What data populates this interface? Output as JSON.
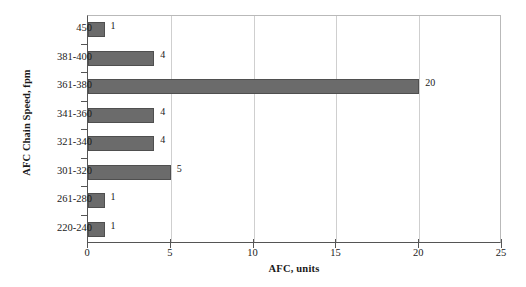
{
  "chart_data": {
    "type": "bar",
    "orientation": "horizontal",
    "title": "",
    "xlabel": "AFC, units",
    "ylabel": "AFC Chain Speed, fpm",
    "categories": [
      "450",
      "381-400",
      "361-380",
      "341-360",
      "321-340",
      "301-320",
      "261-280",
      "220-240"
    ],
    "values": [
      1,
      4,
      20,
      4,
      4,
      5,
      1,
      1
    ],
    "value_labels": [
      "1",
      "4",
      "20",
      "4",
      "4",
      "5",
      "1",
      "1"
    ],
    "xlim": [
      0,
      25
    ],
    "xticks": [
      0,
      5,
      10,
      15,
      20,
      25
    ],
    "xtick_labels": [
      "0",
      "5",
      "10",
      "15",
      "20",
      "25"
    ],
    "grid": "vertical",
    "legend": "none",
    "bar_color": "#6b6b6b",
    "bar_border_color": "#4f4f4f",
    "gridline_color": "#cfcfcf",
    "axis_color": "#555555",
    "text_color": "#1a1a1a"
  }
}
